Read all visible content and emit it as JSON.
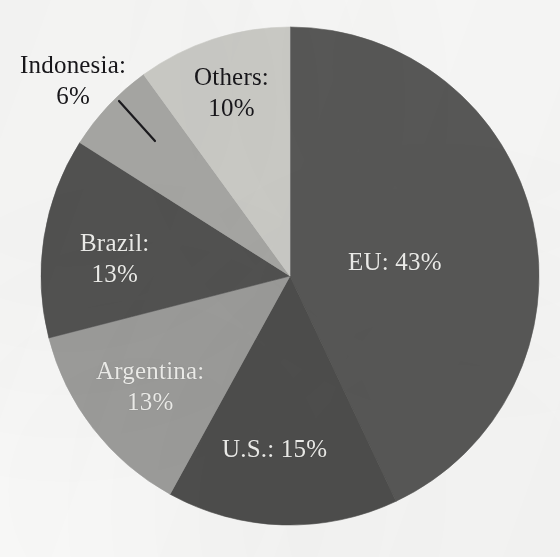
{
  "chart_data": {
    "type": "pie",
    "title": "",
    "subtitle": "",
    "xlabel": "",
    "ylabel": "",
    "legend_position": "none",
    "grid": false,
    "start_angle_deg": 0,
    "direction": "clockwise",
    "unit": "%",
    "categories": [
      "EU",
      "U.S.",
      "Argentina",
      "Brazil",
      "Indonesia",
      "Others"
    ],
    "values": [
      43,
      15,
      13,
      13,
      6,
      10
    ],
    "slices": [
      {
        "id": "eu",
        "name": "EU:",
        "value_text": "43%",
        "value": 43,
        "color": "#595958",
        "label_color": "#f2f2ef",
        "label_placement": "inside",
        "label_style": "inline"
      },
      {
        "id": "us",
        "name": "U.S.:",
        "value_text": "15%",
        "value": 15,
        "color": "#4f4f4e",
        "label_color": "#f2f2ef",
        "label_placement": "inside",
        "label_style": "inline"
      },
      {
        "id": "argentina",
        "name": "Argentina:",
        "value_text": "13%",
        "value": 13,
        "color": "#9e9e9c",
        "label_color": "#f2f2ef",
        "label_placement": "inside",
        "label_style": "stacked"
      },
      {
        "id": "brazil",
        "name": "Brazil:",
        "value_text": "13%",
        "value": 13,
        "color": "#535352",
        "label_color": "#f2f2ef",
        "label_placement": "inside",
        "label_style": "stacked"
      },
      {
        "id": "indonesia",
        "name": "Indonesia:",
        "value_text": "6%",
        "value": 6,
        "color": "#a9a9a6",
        "label_color": "#17161a",
        "label_placement": "outside",
        "label_style": "stacked",
        "has_leader_line": true
      },
      {
        "id": "others",
        "name": "Others:",
        "value_text": "10%",
        "value": 10,
        "color": "#cecec9",
        "label_color": "#17161a",
        "label_placement": "inside",
        "label_style": "stacked"
      }
    ]
  },
  "geometry": {
    "center_x": 290,
    "center_y": 276,
    "radius": 249
  },
  "colors": {
    "background": "#fbfbfa",
    "leader_line": "#1b1a1e"
  }
}
